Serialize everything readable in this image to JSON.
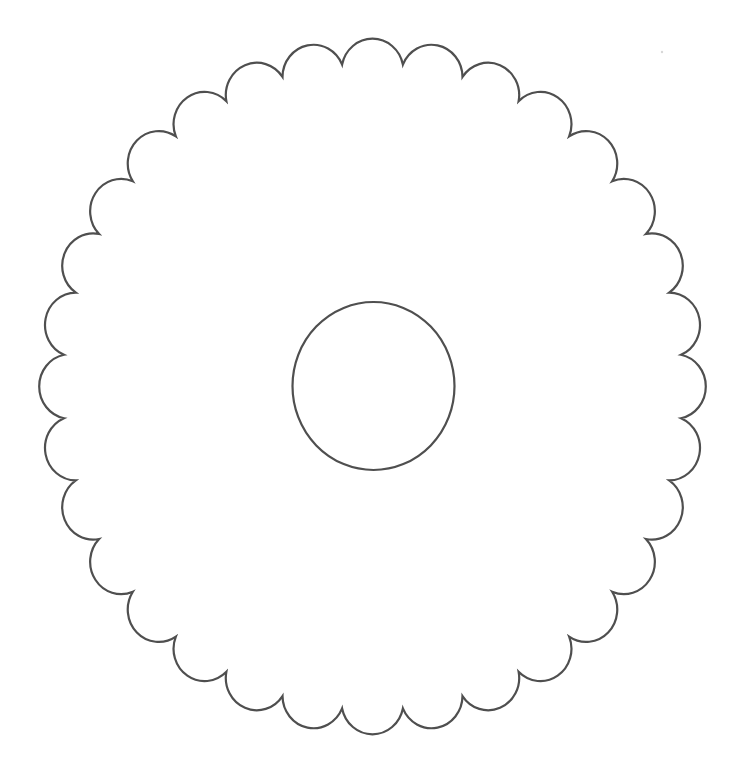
{
  "figure": {
    "canvas": {
      "width": 751,
      "height": 768,
      "background": "#ffffff"
    },
    "stroke_color": "#4f4f4f",
    "outer_scalloped_circle": {
      "center": [
        372.5,
        386.5
      ],
      "scallop_count": 32,
      "peak_radius_x": 335.5,
      "peak_radius_y": 345.5,
      "cusp_radius_x": 310,
      "cusp_radius_y": 323.5,
      "first_scallop_angle_deg": 90
    },
    "inner_circle": {
      "center": [
        373.5,
        386
      ],
      "radius_x": 81,
      "radius_y": 84
    },
    "speck": {
      "x": 662,
      "y": 52,
      "r": 1.2
    }
  }
}
